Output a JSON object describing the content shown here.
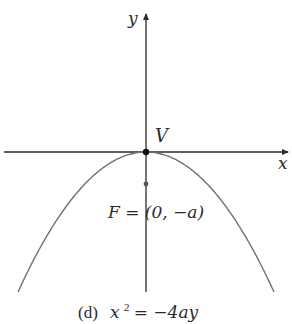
{
  "figure": {
    "caption_label": "(d)",
    "caption_lhs_base": "x",
    "caption_lhs_exp": "2",
    "caption_rhs": " = −4ay",
    "axis_x_label": "x",
    "axis_y_label": "y",
    "vertex_label": "V",
    "focus_label": "F = (0, −a)",
    "equation": "x^2 = -4ay",
    "opens": "down",
    "vertex": [
      0,
      0
    ],
    "focus": [
      0,
      "-a"
    ],
    "colors": {
      "axes": "#2a2a2a",
      "curve": "#707070",
      "points": "#111111",
      "focus_point": "#555555"
    }
  }
}
